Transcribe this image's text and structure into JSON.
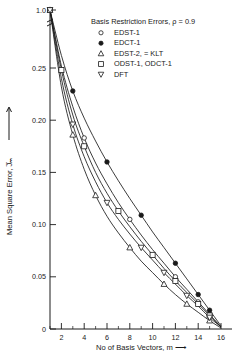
{
  "chart_data": {
    "type": "line",
    "title": "Basis Restriction Errors, ρ = 0.9",
    "xlabel": "No of Basis Vectors, m ⟶",
    "ylabel": "Mean Square Error, J̅ₘ",
    "xlim": [
      1,
      16
    ],
    "ylim": [
      0,
      0.27
    ],
    "y_axis_note": "broken axis: top tick is 1.0",
    "grid": false,
    "legend_position": "top-right",
    "xticks": [
      "2",
      "4",
      "6",
      "8",
      "10",
      "12",
      "14",
      "16"
    ],
    "xtick_values": [
      2,
      4,
      6,
      8,
      10,
      12,
      14,
      16
    ],
    "yticks": [
      "0",
      "0.05",
      "0.10",
      "0.15",
      "0.20",
      "0.25",
      "1.0"
    ],
    "ytick_values": [
      0,
      0.05,
      0.1,
      0.15,
      0.2,
      0.25,
      1.0
    ],
    "x": [
      1,
      2,
      3,
      4,
      5,
      6,
      7,
      8,
      9,
      10,
      11,
      12,
      13,
      14,
      15,
      16
    ],
    "series": [
      {
        "name": "EDST-1",
        "marker": "circle-open",
        "values": [
          1.0,
          0.252,
          0.213,
          0.183,
          0.159,
          0.139,
          0.121,
          0.105,
          0.09,
          0.076,
          0.063,
          0.05,
          0.038,
          0.026,
          0.014,
          0.002
        ],
        "marker_x": [
          1,
          4,
          8,
          12,
          14,
          15
        ]
      },
      {
        "name": "EDCT-1",
        "marker": "circle-filled",
        "values": [
          1.0,
          0.262,
          0.228,
          0.202,
          0.18,
          0.16,
          0.142,
          0.125,
          0.109,
          0.093,
          0.078,
          0.063,
          0.048,
          0.033,
          0.018,
          0.003
        ],
        "marker_x": [
          1,
          3,
          6,
          9,
          12,
          14,
          15
        ]
      },
      {
        "name": "EDST-2, = KLT",
        "marker": "triangle-up",
        "values": [
          1.0,
          0.232,
          0.186,
          0.153,
          0.128,
          0.108,
          0.092,
          0.078,
          0.065,
          0.054,
          0.043,
          0.033,
          0.024,
          0.016,
          0.008,
          0.001
        ],
        "marker_x": [
          1,
          3,
          5,
          8,
          11,
          13,
          15
        ]
      },
      {
        "name": "ODST-1, ODCT-1",
        "marker": "square-open",
        "values": [
          1.0,
          0.248,
          0.205,
          0.175,
          0.15,
          0.13,
          0.113,
          0.098,
          0.084,
          0.071,
          0.058,
          0.046,
          0.035,
          0.024,
          0.013,
          0.002
        ],
        "marker_x": [
          1,
          2,
          4,
          7,
          10,
          12,
          14,
          15
        ]
      },
      {
        "name": "DFT",
        "marker": "triangle-down",
        "values": [
          1.0,
          0.24,
          0.196,
          0.165,
          0.141,
          0.121,
          0.105,
          0.091,
          0.078,
          0.066,
          0.054,
          0.043,
          0.032,
          0.022,
          0.011,
          0.002
        ],
        "marker_x": [
          1,
          3,
          6,
          9,
          11,
          13,
          15
        ]
      }
    ]
  },
  "legend": {
    "title": "Basis Restriction Errors, ρ = 0.9",
    "items": [
      {
        "label": "EDST-1",
        "marker": "circle-open"
      },
      {
        "label": "EDCT-1",
        "marker": "circle-filled"
      },
      {
        "label": "EDST-2, = KLT",
        "marker": "triangle-up"
      },
      {
        "label": "ODST-1, ODCT-1",
        "marker": "square-open"
      },
      {
        "label": "DFT",
        "marker": "triangle-down"
      }
    ]
  },
  "axes": {
    "x_title": "No of Basis Vectors, m ⟶",
    "y_title": "Mean Square Error, J̅ₘ",
    "x_labels": [
      "2",
      "4",
      "6",
      "8",
      "10",
      "12",
      "14",
      "16"
    ],
    "y_labels": [
      "0",
      "0.05",
      "0.10",
      "0.15",
      "0.20",
      "0.25",
      "1.0"
    ]
  }
}
